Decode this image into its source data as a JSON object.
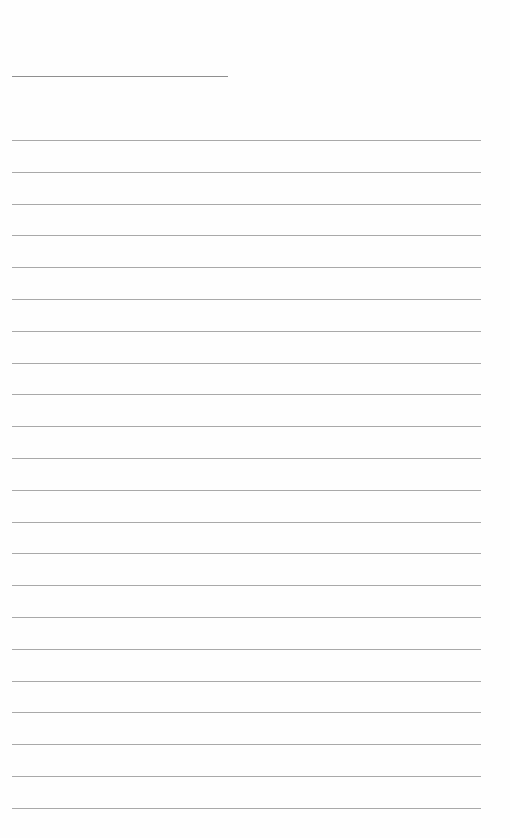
{
  "page": {
    "type": "blank-lined-sheet",
    "header_line": {
      "x": 12,
      "y": 76,
      "width": 216,
      "color": "#8f8f8f"
    },
    "ruled_lines": {
      "count": 22,
      "start_y": 140,
      "spacing": 31.8,
      "x": 12,
      "width": 469,
      "color": "#a9a9a9"
    }
  }
}
